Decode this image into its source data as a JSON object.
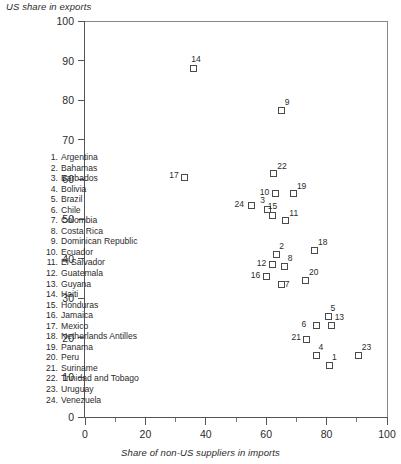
{
  "chart_data": {
    "type": "scatter",
    "title": "",
    "xlabel": "Share of non-US suppliers in imports",
    "ylabel": "US share in exports",
    "xlim": [
      0,
      100
    ],
    "ylim": [
      0,
      100
    ],
    "xticks": [
      0,
      20,
      40,
      60,
      80,
      100
    ],
    "xticks_minor": [
      10,
      30,
      50,
      70,
      90
    ],
    "yticks": [
      0,
      10,
      20,
      30,
      40,
      50,
      60,
      70,
      80,
      90,
      100
    ],
    "grid": false,
    "legend_position": "inside-left",
    "marker": "open-square",
    "points": [
      {
        "id": 1,
        "label": "Argentina",
        "x": 81.0,
        "y": 13.0
      },
      {
        "id": 2,
        "label": "Bahamas",
        "x": 63.5,
        "y": 41.0
      },
      {
        "id": 3,
        "label": "Barbados",
        "x": 60.5,
        "y": 52.5
      },
      {
        "id": 4,
        "label": "Bolivia",
        "x": 76.5,
        "y": 15.5
      },
      {
        "id": 5,
        "label": "Brazil",
        "x": 80.5,
        "y": 25.5
      },
      {
        "id": 6,
        "label": "Chile",
        "x": 76.5,
        "y": 23.0
      },
      {
        "id": 7,
        "label": "Colombia",
        "x": 65.0,
        "y": 33.5
      },
      {
        "id": 8,
        "label": "Costa Rica",
        "x": 66.0,
        "y": 38.0
      },
      {
        "id": 9,
        "label": "Dominican Republic",
        "x": 65.0,
        "y": 77.5
      },
      {
        "id": 10,
        "label": "Ecuador",
        "x": 63.0,
        "y": 56.5
      },
      {
        "id": 11,
        "label": "El Salvador",
        "x": 66.5,
        "y": 49.5
      },
      {
        "id": 12,
        "label": "Guatemala",
        "x": 62.0,
        "y": 38.5
      },
      {
        "id": 13,
        "label": "Guyana",
        "x": 81.5,
        "y": 23.0
      },
      {
        "id": 14,
        "label": "Haiti",
        "x": 36.0,
        "y": 88.0
      },
      {
        "id": 15,
        "label": "Honduras",
        "x": 62.0,
        "y": 51.0
      },
      {
        "id": 16,
        "label": "Jamaica",
        "x": 60.0,
        "y": 35.5
      },
      {
        "id": 17,
        "label": "Mexico",
        "x": 33.0,
        "y": 60.5
      },
      {
        "id": 18,
        "label": "Netherlands Antilles",
        "x": 76.0,
        "y": 42.0
      },
      {
        "id": 19,
        "label": "Panama",
        "x": 69.0,
        "y": 56.5
      },
      {
        "id": 20,
        "label": "Peru",
        "x": 73.0,
        "y": 34.5
      },
      {
        "id": 21,
        "label": "Suriname",
        "x": 73.5,
        "y": 19.5
      },
      {
        "id": 22,
        "label": "Trinidad and Tobago",
        "x": 62.5,
        "y": 61.5
      },
      {
        "id": 23,
        "label": "Uruguay",
        "x": 90.5,
        "y": 15.5
      },
      {
        "id": 24,
        "label": "Venezuela",
        "x": 55.0,
        "y": 53.5
      }
    ],
    "label_offsets": [
      {
        "id": 1,
        "dx": 6,
        "dy": -9
      },
      {
        "id": 2,
        "dx": 6,
        "dy": -9
      },
      {
        "id": 3,
        "dx": -4,
        "dy": -10
      },
      {
        "id": 4,
        "dx": 6,
        "dy": -9
      },
      {
        "id": 5,
        "dx": 6,
        "dy": -9
      },
      {
        "id": 6,
        "dx": -11,
        "dy": -2
      },
      {
        "id": 7,
        "dx": 7,
        "dy": -1
      },
      {
        "id": 8,
        "dx": 7,
        "dy": -9
      },
      {
        "id": 9,
        "dx": 7,
        "dy": -9
      },
      {
        "id": 10,
        "dx": -12,
        "dy": -2
      },
      {
        "id": 11,
        "dx": 7,
        "dy": -8
      },
      {
        "id": 12,
        "dx": -12,
        "dy": -2
      },
      {
        "id": 13,
        "dx": 7,
        "dy": -9
      },
      {
        "id": 14,
        "dx": 1,
        "dy": -10
      },
      {
        "id": 15,
        "dx": -1,
        "dy": -10
      },
      {
        "id": 16,
        "dx": -12,
        "dy": -2
      },
      {
        "id": 17,
        "dx": -12,
        "dy": -3
      },
      {
        "id": 18,
        "dx": 7,
        "dy": -9
      },
      {
        "id": 19,
        "dx": 7,
        "dy": -8
      },
      {
        "id": 20,
        "dx": 7,
        "dy": -9
      },
      {
        "id": 21,
        "dx": -12,
        "dy": -3
      },
      {
        "id": 22,
        "dx": 7,
        "dy": -8
      },
      {
        "id": 23,
        "dx": 7,
        "dy": -9
      },
      {
        "id": 24,
        "dx": -13,
        "dy": -2
      }
    ]
  },
  "legend": {
    "items": [
      {
        "num": "1.",
        "name": "Argentina"
      },
      {
        "num": "2.",
        "name": "Bahamas"
      },
      {
        "num": "3.",
        "name": "Barbados"
      },
      {
        "num": "4.",
        "name": "Bolivia"
      },
      {
        "num": "5.",
        "name": "Brazil"
      },
      {
        "num": "6.",
        "name": "Chile"
      },
      {
        "num": "7.",
        "name": "Colombia"
      },
      {
        "num": "8.",
        "name": "Costa Rica"
      },
      {
        "num": "9.",
        "name": "Dominican Republic"
      },
      {
        "num": "10.",
        "name": "Ecuador"
      },
      {
        "num": "11.",
        "name": "El Salvador"
      },
      {
        "num": "12.",
        "name": "Guatemala"
      },
      {
        "num": "13.",
        "name": "Guyana"
      },
      {
        "num": "14.",
        "name": "Haiti"
      },
      {
        "num": "15.",
        "name": "Honduras"
      },
      {
        "num": "16.",
        "name": "Jamaica"
      },
      {
        "num": "17.",
        "name": "Mexico"
      },
      {
        "num": "18.",
        "name": "Netherlands Antilles"
      },
      {
        "num": "19.",
        "name": "Panama"
      },
      {
        "num": "20.",
        "name": "Peru"
      },
      {
        "num": "21.",
        "name": "Suriname"
      },
      {
        "num": "22.",
        "name": "Trinidad and Tobago"
      },
      {
        "num": "23.",
        "name": "Uruguay"
      },
      {
        "num": "24.",
        "name": "Venezuela"
      }
    ]
  },
  "colors": {
    "marker_stroke": "#4a4a4a",
    "axis": "#555555",
    "text": "#2b2b2b"
  }
}
